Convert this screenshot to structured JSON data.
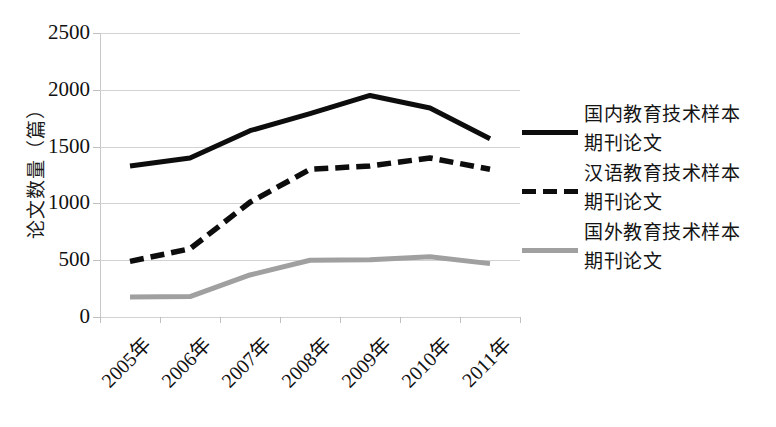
{
  "chart_data": {
    "type": "line",
    "title": "",
    "xlabel": "",
    "ylabel": "论文数量（篇）",
    "categories": [
      "2005年",
      "2006年",
      "2007年",
      "2008年",
      "2009年",
      "2010年",
      "2011年"
    ],
    "ylim": [
      0,
      2500
    ],
    "yticks": [
      0,
      500,
      1000,
      1500,
      2000,
      2500
    ],
    "ytick_labels": [
      "0",
      "500",
      "1000",
      "1500",
      "2000",
      "2500"
    ],
    "grid": true,
    "legend_position": "right",
    "series": [
      {
        "name": "国内教育技术样本期刊论文",
        "name_line1": "国内教育技术样本",
        "name_line2": "期刊论文",
        "style": "solid",
        "color": "#0d0d0d",
        "values": [
          1330,
          1400,
          1640,
          1790,
          1950,
          1840,
          1570
        ]
      },
      {
        "name": "汉语教育技术样本期刊论文",
        "name_line1": "汉语教育技术样本",
        "name_line2": "期刊论文",
        "style": "dashed",
        "color": "#0d0d0d",
        "values": [
          490,
          600,
          1010,
          1300,
          1330,
          1400,
          1300
        ]
      },
      {
        "name": "国外教育技术样本期刊论文",
        "name_line1": "国外教育技术样本",
        "name_line2": "期刊论文",
        "style": "solid",
        "color": "#a0a0a0",
        "values": [
          175,
          180,
          370,
          500,
          505,
          530,
          470
        ]
      }
    ]
  }
}
